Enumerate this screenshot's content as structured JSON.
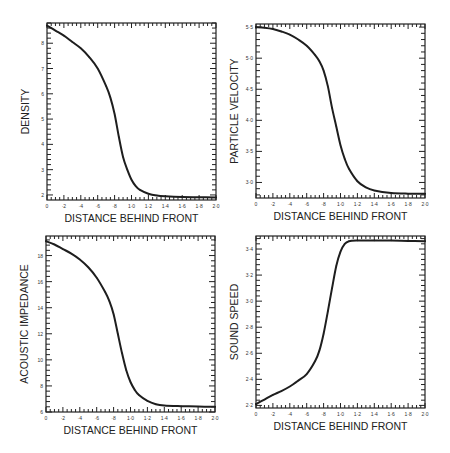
{
  "chart_data": [
    {
      "type": "line",
      "id": "density",
      "title": "",
      "xlabel": "DISTANCE BEHIND FRONT",
      "ylabel": "DENSITY",
      "xlim": [
        0,
        2.0
      ],
      "ylim": [
        1.8,
        8.8
      ],
      "x_ticks": [
        0,
        0.2,
        0.4,
        0.6,
        0.8,
        1.0,
        1.2,
        1.4,
        1.6,
        1.8,
        2.0
      ],
      "x_tick_labels": [
        "0",
        "·2",
        "·4",
        "·6",
        "·8",
        "1·0",
        "1·2",
        "1·4",
        "1·6",
        "1·8",
        "2·0"
      ],
      "y_ticks": [
        2,
        3,
        4,
        5,
        6,
        7,
        8
      ],
      "y_tick_labels": [
        "2",
        "3",
        "4",
        "5",
        "6",
        "7",
        "8"
      ],
      "grid": false,
      "series": [
        {
          "name": "density",
          "x": [
            0,
            0.1,
            0.2,
            0.3,
            0.4,
            0.5,
            0.6,
            0.7,
            0.75,
            0.8,
            0.85,
            0.9,
            0.95,
            1.0,
            1.05,
            1.1,
            1.2,
            1.3,
            1.4,
            1.6,
            1.8,
            2.0
          ],
          "y": [
            8.7,
            8.5,
            8.3,
            8.05,
            7.8,
            7.45,
            7.0,
            6.3,
            5.85,
            5.2,
            4.3,
            3.5,
            3.0,
            2.6,
            2.35,
            2.2,
            2.05,
            1.98,
            1.95,
            1.92,
            1.91,
            1.9
          ]
        }
      ]
    },
    {
      "type": "line",
      "id": "particle-velocity",
      "title": "",
      "xlabel": "DISTANCE BEHIND FRONT",
      "ylabel": "PARTICLE VELOCITY",
      "xlim": [
        0,
        2.0
      ],
      "ylim": [
        2.75,
        5.55
      ],
      "x_ticks": [
        0,
        0.2,
        0.4,
        0.6,
        0.8,
        1.0,
        1.2,
        1.4,
        1.6,
        1.8,
        2.0
      ],
      "x_tick_labels": [
        "0",
        "·2",
        "·4",
        "·6",
        "·8",
        "1·0",
        "1·2",
        "1·4",
        "1·6",
        "1·8",
        "2·0"
      ],
      "y_ticks": [
        3.0,
        3.5,
        4.0,
        4.5,
        5.0,
        5.5
      ],
      "y_tick_labels": [
        "3·0",
        "3·5",
        "4·0",
        "4·5",
        "5·0",
        "5·5"
      ],
      "grid": false,
      "series": [
        {
          "name": "particle velocity",
          "x": [
            0,
            0.1,
            0.2,
            0.3,
            0.4,
            0.5,
            0.6,
            0.7,
            0.75,
            0.8,
            0.85,
            0.9,
            0.95,
            1.0,
            1.05,
            1.1,
            1.2,
            1.3,
            1.4,
            1.6,
            1.8,
            2.0
          ],
          "y": [
            5.5,
            5.49,
            5.47,
            5.43,
            5.38,
            5.3,
            5.2,
            5.05,
            4.95,
            4.8,
            4.55,
            4.2,
            3.9,
            3.6,
            3.38,
            3.22,
            3.02,
            2.92,
            2.87,
            2.83,
            2.82,
            2.82
          ]
        }
      ]
    },
    {
      "type": "line",
      "id": "acoustic-impedance",
      "title": "",
      "xlabel": "DISTANCE BEHIND FRONT",
      "ylabel": "ACOUSTIC IMPEDANCE",
      "xlim": [
        0,
        2.0
      ],
      "ylim": [
        6,
        19.5
      ],
      "x_ticks": [
        0,
        0.2,
        0.4,
        0.6,
        0.8,
        1.0,
        1.2,
        1.4,
        1.6,
        1.8,
        2.0
      ],
      "x_tick_labels": [
        "0",
        "·2",
        "·4",
        "·6",
        "·8",
        "1·0",
        "1·2",
        "1·4",
        "1·6",
        "1·8",
        "2·0"
      ],
      "y_ticks": [
        6,
        8,
        10,
        12,
        14,
        16,
        18
      ],
      "y_tick_labels": [
        "6",
        "8",
        "10",
        "12",
        "14",
        "16",
        "18"
      ],
      "grid": false,
      "series": [
        {
          "name": "acoustic impedance",
          "x": [
            0,
            0.1,
            0.2,
            0.3,
            0.4,
            0.5,
            0.6,
            0.7,
            0.75,
            0.8,
            0.85,
            0.9,
            0.95,
            1.0,
            1.05,
            1.1,
            1.2,
            1.3,
            1.4,
            1.6,
            1.8,
            2.0
          ],
          "y": [
            19.1,
            18.85,
            18.5,
            18.15,
            17.7,
            17.1,
            16.3,
            15.2,
            14.5,
            13.5,
            12.0,
            10.5,
            9.2,
            8.3,
            7.7,
            7.3,
            6.85,
            6.6,
            6.5,
            6.45,
            6.42,
            6.4
          ]
        }
      ]
    },
    {
      "type": "line",
      "id": "sound-speed",
      "title": "",
      "xlabel": "DISTANCE BEHIND FRONT",
      "ylabel": "SOUND SPEED",
      "xlim": [
        0,
        2.0
      ],
      "ylim": [
        2.18,
        3.5
      ],
      "x_ticks": [
        0,
        0.2,
        0.4,
        0.6,
        0.8,
        1.0,
        1.2,
        1.4,
        1.6,
        1.8,
        2.0
      ],
      "x_tick_labels": [
        "0",
        "·2",
        "·4",
        "·6",
        "·8",
        "1·0",
        "1·2",
        "1·4",
        "1·6",
        "1·8",
        "2·0"
      ],
      "y_ticks": [
        2.2,
        2.4,
        2.6,
        2.8,
        3.0,
        3.2,
        3.4
      ],
      "y_tick_labels": [
        "2·2",
        "2·4",
        "2·6",
        "2·8",
        "3·0",
        "3·2",
        "3·4"
      ],
      "grid": false,
      "series": [
        {
          "name": "sound speed",
          "x": [
            0,
            0.1,
            0.2,
            0.3,
            0.4,
            0.5,
            0.6,
            0.7,
            0.75,
            0.8,
            0.85,
            0.9,
            0.95,
            1.0,
            1.05,
            1.1,
            1.2,
            1.4,
            1.6,
            1.8,
            2.0
          ],
          "y": [
            2.21,
            2.245,
            2.28,
            2.31,
            2.345,
            2.39,
            2.44,
            2.54,
            2.62,
            2.75,
            2.92,
            3.1,
            3.27,
            3.38,
            3.44,
            3.46,
            3.465,
            3.465,
            3.465,
            3.462,
            3.46
          ]
        }
      ]
    }
  ]
}
